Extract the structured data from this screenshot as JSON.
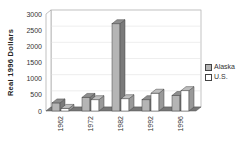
{
  "chart_data": {
    "type": "bar",
    "title": "",
    "xlabel": "",
    "ylabel": "Real 1996 Dollars",
    "ylim": [
      0,
      3000
    ],
    "yticks": [
      0,
      500,
      1000,
      1500,
      2000,
      2500,
      3000
    ],
    "categories": [
      "1962",
      "1972",
      "1982",
      "1992",
      "1996"
    ],
    "series": [
      {
        "name": "Alaska",
        "color": "#b5b5b5",
        "values": [
          250,
          420,
          2700,
          350,
          480
        ]
      },
      {
        "name": "U.S.",
        "color": "#ffffff",
        "values": [
          80,
          350,
          380,
          550,
          630
        ]
      }
    ],
    "grid": true,
    "legend_position": "right",
    "style": "3d-clustered-bar"
  },
  "legend": {
    "items": [
      {
        "label": "Alaska",
        "color": "#b5b5b5"
      },
      {
        "label": "U.S.",
        "color": "#ffffff"
      }
    ]
  }
}
